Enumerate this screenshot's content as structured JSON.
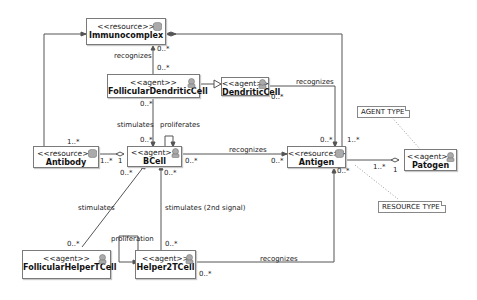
{
  "classes": {
    "immunocomplex": {
      "stereotype": "<<resource>>",
      "name": "Immunocomplex",
      "icon": "database-icon"
    },
    "follicular_dendritic": {
      "stereotype": "<<agent>>",
      "name": "FollicularDendriticCell",
      "icon": "agent-icon"
    },
    "dendritic": {
      "stereotype": "<<agent>>",
      "name": "DendriticCell",
      "icon": "agent-icon"
    },
    "antibody": {
      "stereotype": "<<resource>>",
      "name": "Antibody",
      "icon": "database-icon"
    },
    "bcell": {
      "stereotype": "<<agent>>",
      "name": "BCell",
      "icon": "agent-icon"
    },
    "antigen": {
      "stereotype": "<<resource>>",
      "name": "Antigen",
      "icon": "database-icon"
    },
    "patogen": {
      "stereotype": "<<agent>>",
      "name": "Patogen",
      "icon": "agent-icon"
    },
    "follicular_helper": {
      "stereotype": "<<agent>>",
      "name": "FollicularHelperTCell",
      "icon": "agent-icon"
    },
    "helper2": {
      "stereotype": "<<agent>>",
      "name": "Helper2TCell",
      "icon": "agent-icon"
    }
  },
  "notes": {
    "agent_type": "AGENT TYPE",
    "resource_type": "RESOURCE TYPE"
  },
  "labels": {
    "recognizes_fdc": "recognizes",
    "fdc_top_mult": "0..*",
    "imm_bottom_mult": "0..*",
    "recognizes_dc": "recognizes",
    "dc_mult": "0..*",
    "antibody_top_mult": "1..*",
    "fdc_bottom_mult": "0..*",
    "stimulates_fdc": "stimulates",
    "proliferates": "proliferates",
    "bcell_top_mult": "0..*",
    "antibody_right_mult": "1..*",
    "bcell_left_mult": "1",
    "bcell_right_mult": "0..*",
    "recognizes_bcell": "recognizes",
    "antigen_left_mult": "0..*",
    "antigen_top_left_mult": "0..*",
    "antigen_top_right_mult": "1..*",
    "antigen_right_mult": "1..*",
    "patogen_left_mult": "1",
    "antigen_bottom_mult": "0..*",
    "bcell_bottom_left_mult": "0..*",
    "bcell_bottom_right_mult": "0..*",
    "stimulates_fht": "stimulates",
    "stimulates_2nd": "stimulates (2nd signal)",
    "fht_top_mult": "0..*",
    "proliferation": "proliferation",
    "h2_top_mult": "0..*",
    "h2_right_mult": "0..*",
    "recognizes_h2": "recognizes"
  },
  "colors": {
    "line": "#555555",
    "border": "#7a7a7a",
    "icon": "#9a9a9a"
  }
}
